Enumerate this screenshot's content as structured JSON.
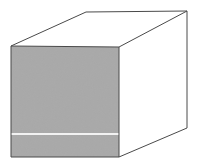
{
  "figure": {
    "type": "3d-solid-illustration",
    "canvas": {
      "width": 197,
      "height": 165,
      "background": "#ffffff"
    },
    "style": {
      "stroke_color": "#4a4a4a",
      "stroke_width": 1,
      "front_face_fill": "#a9a9a9",
      "top_face_fill": "#ffffff",
      "side_face_fill": "#ffffff",
      "divider_line_color": "#f2f2f2"
    },
    "vertices": {
      "front_top_left": [
        11,
        46
      ],
      "front_top_right": [
        119,
        47
      ],
      "front_bottom_right": [
        119,
        157
      ],
      "front_bottom_left": [
        11,
        157
      ],
      "back_top_left": [
        86,
        12
      ],
      "back_top_right": [
        187,
        11
      ],
      "back_bottom_right": [
        187,
        128
      ]
    },
    "faces": [
      {
        "name": "front-face",
        "label": "front face",
        "fill": "#a9a9a9",
        "points": "11,46 119,47 119,157 11,157"
      },
      {
        "name": "top-face",
        "label": "top face",
        "fill": "#ffffff",
        "points": "11,46 86,12 187,11 119,47"
      },
      {
        "name": "right-face",
        "label": "right side face",
        "fill": "#ffffff",
        "points": "119,47 187,11 187,128 119,157"
      }
    ],
    "edges": [
      {
        "name": "front-top-edge",
        "points": "11,46 119,47"
      },
      {
        "name": "front-right-edge",
        "points": "119,47 119,157"
      },
      {
        "name": "front-bottom-edge",
        "points": "11,157 119,157"
      },
      {
        "name": "front-left-edge",
        "points": "11,46 11,157"
      },
      {
        "name": "top-left-receding-edge",
        "points": "11,46 86,12"
      },
      {
        "name": "top-back-edge",
        "points": "86,12 187,11"
      },
      {
        "name": "top-right-receding-edge",
        "points": "187,11 119,47"
      },
      {
        "name": "back-right-vertical-edge",
        "points": "187,11 187,128"
      },
      {
        "name": "bottom-right-receding-edge",
        "points": "119,157 187,128"
      }
    ],
    "divider": {
      "name": "front-face-divider-line",
      "label": "horizontal divider line on front face",
      "points": "11,134 119,134",
      "color": "#f2f2f2",
      "width": 2
    }
  }
}
